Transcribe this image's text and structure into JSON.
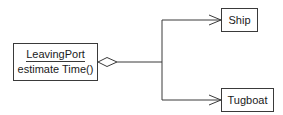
{
  "diagram": {
    "type": "UML class diagram (aggregation)",
    "classes": [
      {
        "id": "leavingport",
        "name": "LeavingPort",
        "operations": [
          "estimate Time()"
        ]
      },
      {
        "id": "ship",
        "name": "Ship"
      },
      {
        "id": "tugboat",
        "name": "Tugboat"
      }
    ],
    "relations": [
      {
        "from": "LeavingPort",
        "to": "Ship",
        "kind": "aggregation",
        "source_end": "hollow-diamond",
        "target_end": "open-arrow"
      },
      {
        "from": "LeavingPort",
        "to": "Tugboat",
        "kind": "aggregation",
        "source_end": "hollow-diamond",
        "target_end": "open-arrow"
      }
    ],
    "colors": {
      "line": "#3a3a3a",
      "background": "#ffffff",
      "text": "#1a1a1a"
    }
  }
}
